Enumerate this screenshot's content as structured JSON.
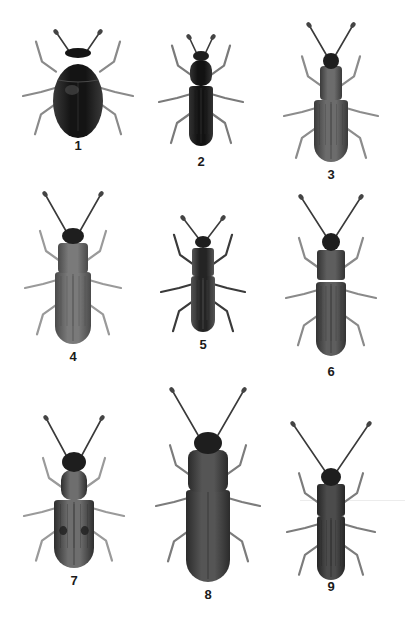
{
  "plate": {
    "background": "#ffffff",
    "label_color": "#1a1a1a",
    "specimens": [
      {
        "number": "1",
        "label": "1",
        "cx": 78,
        "label_y": 139,
        "shape": "oval",
        "head": {
          "y": 48,
          "w": 26,
          "h": 10
        },
        "pronotum": {
          "y": 50,
          "w": 48,
          "h": 36,
          "r": 18
        },
        "elytra": {
          "y": 80,
          "w": 50,
          "h": 54
        },
        "antennae_len": 16,
        "antenna_spread": 22,
        "fill": "#141414",
        "shade": "#3a3a3a",
        "leg_color": "#8a8a8a",
        "striae": false
      },
      {
        "number": "2",
        "label": "2",
        "cx": 201,
        "label_y": 155,
        "shape": "elongate",
        "head": {
          "y": 51,
          "w": 16,
          "h": 10
        },
        "pronotum": {
          "y": 60,
          "w": 22,
          "h": 26,
          "r": 10
        },
        "elytra": {
          "y": 86,
          "w": 24,
          "h": 60
        },
        "antennae_len": 14,
        "antenna_spread": 12,
        "fill": "#121212",
        "shade": "#333333",
        "leg_color": "#7a7a7a",
        "striae": true
      },
      {
        "number": "3",
        "label": "3",
        "cx": 331,
        "label_y": 168,
        "shape": "weevil",
        "head": {
          "y": 53,
          "w": 16,
          "h": 16
        },
        "pronotum": {
          "y": 66,
          "w": 22,
          "h": 34,
          "r": 4
        },
        "elytra": {
          "y": 100,
          "w": 34,
          "h": 62
        },
        "antennae_len": 28,
        "antenna_spread": 22,
        "fill": "#6c6c6c",
        "shade": "#3a3a3a",
        "leg_color": "#8c8c8c",
        "striae": true
      },
      {
        "number": "4",
        "label": "4",
        "cx": 73,
        "label_y": 350,
        "shape": "flat",
        "head": {
          "y": 228,
          "w": 22,
          "h": 16
        },
        "pronotum": {
          "y": 243,
          "w": 30,
          "h": 30,
          "r": 4
        },
        "elytra": {
          "y": 272,
          "w": 36,
          "h": 72
        },
        "antennae_len": 34,
        "antenna_spread": 28,
        "fill": "#7a7a7a",
        "shade": "#4a4a4a",
        "leg_color": "#9a9a9a",
        "striae": true
      },
      {
        "number": "5",
        "label": "5",
        "cx": 203,
        "label_y": 338,
        "shape": "elongate",
        "head": {
          "y": 236,
          "w": 16,
          "h": 12
        },
        "pronotum": {
          "y": 248,
          "w": 22,
          "h": 28,
          "r": 3
        },
        "elytra": {
          "y": 276,
          "w": 24,
          "h": 56
        },
        "antennae_len": 18,
        "antenna_spread": 20,
        "fill": "#242424",
        "shade": "#555555",
        "leg_color": "#3a3a3a",
        "striae": true
      },
      {
        "number": "6",
        "label": "6",
        "cx": 331,
        "label_y": 365,
        "shape": "flat",
        "head": {
          "y": 233,
          "w": 18,
          "h": 18
        },
        "pronotum": {
          "y": 250,
          "w": 28,
          "h": 30,
          "r": 3
        },
        "elytra": {
          "y": 282,
          "w": 30,
          "h": 74
        },
        "antennae_len": 36,
        "antenna_spread": 30,
        "fill": "#5e5e5e",
        "shade": "#333333",
        "leg_color": "#8a8a8a",
        "striae": true
      },
      {
        "number": "7",
        "label": "7",
        "cx": 74,
        "label_y": 574,
        "shape": "spotted",
        "head": {
          "y": 452,
          "w": 24,
          "h": 20
        },
        "pronotum": {
          "y": 470,
          "w": 26,
          "h": 30,
          "r": 10
        },
        "elytra": {
          "y": 500,
          "w": 40,
          "h": 68
        },
        "antennae_len": 34,
        "antenna_spread": 28,
        "fill": "#6e6e6e",
        "shade": "#2e2e2e",
        "leg_color": "#9a9a9a",
        "striae": true,
        "spots": true
      },
      {
        "number": "8",
        "label": "8",
        "cx": 208,
        "label_y": 588,
        "shape": "flat",
        "head": {
          "y": 432,
          "w": 28,
          "h": 22
        },
        "pronotum": {
          "y": 450,
          "w": 40,
          "h": 42,
          "r": 8
        },
        "elytra": {
          "y": 490,
          "w": 44,
          "h": 92
        },
        "antennae_len": 42,
        "antenna_spread": 36,
        "fill": "#555555",
        "shade": "#2b2b2b",
        "leg_color": "#7c7c7c",
        "striae": false
      },
      {
        "number": "9",
        "label": "9",
        "cx": 331,
        "label_y": 580,
        "shape": "flat",
        "head": {
          "y": 468,
          "w": 20,
          "h": 18
        },
        "pronotum": {
          "y": 484,
          "w": 28,
          "h": 32,
          "r": 3
        },
        "elytra": {
          "y": 516,
          "w": 28,
          "h": 64
        },
        "antennae_len": 44,
        "antenna_spread": 38,
        "fill": "#4c4c4c",
        "shade": "#262626",
        "leg_color": "#7c7c7c",
        "striae": true
      }
    ]
  }
}
